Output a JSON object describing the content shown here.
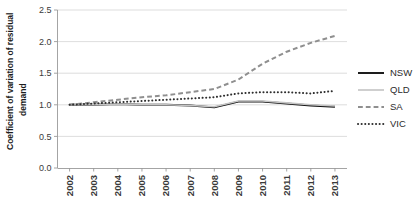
{
  "chart_data": {
    "type": "line",
    "title": "",
    "xlabel": "",
    "ylabel": "Coefficient of variation of residual demand",
    "ylabel_line1": "Coefficient of variation of residual",
    "ylabel_line2": "demand",
    "categories": [
      "2002",
      "2003",
      "2004",
      "2005",
      "2006",
      "2007",
      "2008",
      "2009",
      "2010",
      "2011",
      "2012",
      "2013"
    ],
    "x": [
      2002,
      2003,
      2004,
      2005,
      2006,
      2007,
      2008,
      2009,
      2010,
      2011,
      2012,
      2013
    ],
    "ylim": [
      0.0,
      2.5
    ],
    "yticks": [
      "0.0",
      "0.5",
      "1.0",
      "1.5",
      "2.0",
      "2.5"
    ],
    "ytick_values": [
      0.0,
      0.5,
      1.0,
      1.5,
      2.0,
      2.5
    ],
    "grid": true,
    "legend_position": "right",
    "series": [
      {
        "name": "NSW",
        "style": "solid",
        "color": "#111111",
        "width": 1.9,
        "values": [
          1.0,
          1.0,
          1.01,
          1.0,
          1.0,
          0.99,
          0.96,
          1.05,
          1.05,
          1.02,
          0.99,
          0.97
        ]
      },
      {
        "name": "QLD",
        "style": "solid",
        "color": "#c4c4c4",
        "width": 1.6,
        "values": [
          1.0,
          1.0,
          1.01,
          1.0,
          1.0,
          0.99,
          0.97,
          1.06,
          1.06,
          1.03,
          1.0,
          0.98
        ]
      },
      {
        "name": "SA",
        "style": "dashed",
        "color": "#8f8f8f",
        "width": 2.0,
        "values": [
          1.0,
          1.04,
          1.08,
          1.12,
          1.15,
          1.2,
          1.25,
          1.4,
          1.65,
          1.84,
          1.98,
          2.09
        ]
      },
      {
        "name": "VIC",
        "style": "dotted",
        "color": "#2e2e2e",
        "width": 2.0,
        "values": [
          1.0,
          1.02,
          1.04,
          1.06,
          1.08,
          1.1,
          1.12,
          1.18,
          1.2,
          1.2,
          1.18,
          1.22
        ]
      }
    ]
  },
  "legend": {
    "items": [
      {
        "label": "NSW"
      },
      {
        "label": "QLD"
      },
      {
        "label": "SA"
      },
      {
        "label": "VIC"
      }
    ]
  },
  "colors": {
    "nsw": "#111111",
    "qld": "#c4c4c4",
    "sa": "#8f8f8f",
    "vic": "#2e2e2e",
    "grid": "#d4d4d4",
    "axis": "#9a9a9a",
    "text": "#2b2b2b",
    "background": "#ffffff"
  }
}
